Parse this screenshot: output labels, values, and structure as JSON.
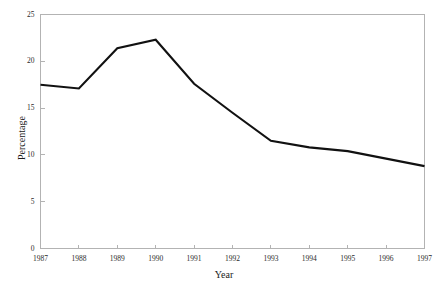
{
  "chart_data": {
    "type": "line",
    "title": "",
    "subtitle": "",
    "xlabel": "Year",
    "ylabel": "Percentage",
    "categories": [
      "1987",
      "1988",
      "1989",
      "1990",
      "1991",
      "1992",
      "1993",
      "1994",
      "1995",
      "1996",
      "1997"
    ],
    "x": [
      1987,
      1988,
      1989,
      1990,
      1991,
      1992,
      1993,
      1994,
      1995,
      1996,
      1997
    ],
    "values": [
      17.5,
      17.1,
      21.4,
      22.3,
      17.6,
      14.5,
      11.5,
      10.8,
      10.4,
      9.6,
      8.8
    ],
    "series": [
      {
        "name": "Percentage",
        "values": [
          17.5,
          17.1,
          21.4,
          22.3,
          17.6,
          14.5,
          11.5,
          10.8,
          10.4,
          9.6,
          8.8
        ],
        "color": "#111111"
      }
    ],
    "xlim": [
      1987,
      1997
    ],
    "ylim": [
      0,
      25
    ],
    "yticks": [
      0,
      5,
      10,
      15,
      20,
      25
    ],
    "ytick_labels": [
      "0",
      "5",
      "10",
      "15",
      "20",
      "25"
    ],
    "xticks": [
      1987,
      1988,
      1989,
      1990,
      1991,
      1992,
      1993,
      1994,
      1995,
      1996,
      1997
    ],
    "xtick_labels": [
      "1987",
      "1988",
      "1989",
      "1990",
      "1991",
      "1992",
      "1993",
      "1994",
      "1995",
      "1996",
      "1997"
    ],
    "grid": false,
    "legend": false,
    "legend_position": "none",
    "annotations": [],
    "line_color": "#111111",
    "axis_color": "#b3b3b3",
    "background_color": "#ffffff"
  },
  "axes": {
    "y_title": "Percentage",
    "x_title": "Year"
  }
}
